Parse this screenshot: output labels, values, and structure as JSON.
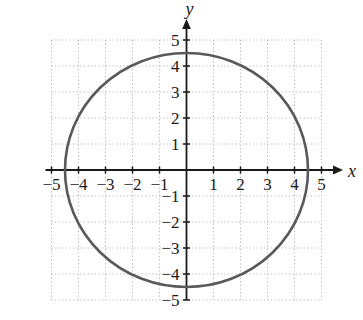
{
  "figure": {
    "colors": {
      "background": "#ffffff",
      "axis": "#1a1a1a",
      "grid": "#b5b5b5",
      "curve": "#59595b",
      "text": "#1a1a1a"
    }
  },
  "chart_data": {
    "type": "line",
    "subtype": "circle-on-coordinate-plane",
    "title": "",
    "xlabel": "x",
    "ylabel": "y",
    "xlim": [
      -5,
      5
    ],
    "ylim": [
      -5,
      5
    ],
    "grid": "dotted",
    "legend": "none",
    "x_tick_values": [
      -5,
      -4,
      -3,
      -2,
      -1,
      1,
      2,
      3,
      4,
      5
    ],
    "x_tick_labels": [
      "−5",
      "−4",
      "−3",
      "−2",
      "−1",
      "1",
      "2",
      "3",
      "4",
      "5"
    ],
    "y_tick_values": [
      5,
      4,
      3,
      2,
      1,
      -1,
      -2,
      -3,
      -4,
      -5
    ],
    "y_tick_labels": [
      "5",
      "4",
      "3",
      "2",
      "1",
      "−1",
      "−2",
      "−3",
      "−4",
      "−5"
    ],
    "series": [
      {
        "name": "circle",
        "shape": "circle",
        "center_x": 0,
        "center_y": 0,
        "radius": 4.5,
        "x_intercepts": [
          -4.5,
          4.5
        ],
        "y_intercepts": [
          -4.5,
          4.5
        ]
      }
    ]
  }
}
